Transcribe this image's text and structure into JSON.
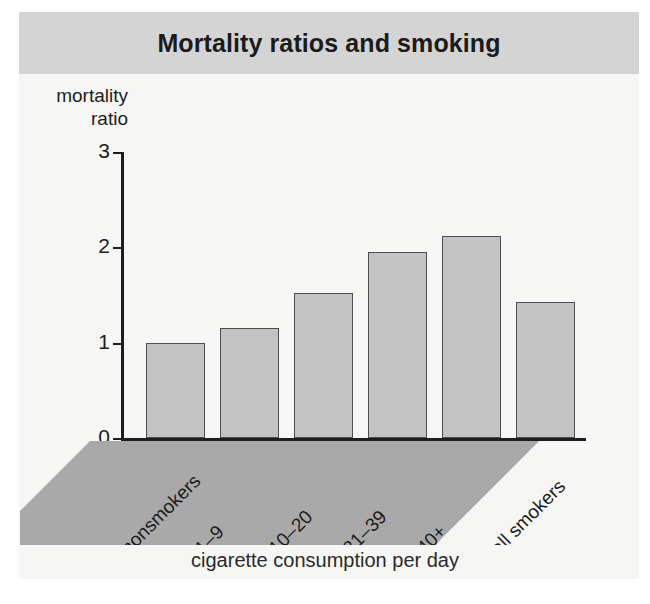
{
  "figure": {
    "title": "Mortality ratios and smoking",
    "background_color": "#f6f6f5",
    "title_bar_color": "#d4d4d4",
    "bar_fill_color": "#c3c3c3",
    "bar_edge_color": "#4e4e4e",
    "band_color": "#a9a9a9"
  },
  "chart_data": {
    "type": "bar",
    "title": "Mortality ratios and smoking",
    "xlabel": "cigarette consumption per day",
    "ylabel": "mortality ratio",
    "ylabel_lines": [
      "mortality",
      "ratio"
    ],
    "categories": [
      "nonsmokers",
      "1–9",
      "10–20",
      "21–39",
      "40+",
      "all smokers"
    ],
    "values": [
      1.0,
      1.15,
      1.52,
      1.95,
      2.12,
      1.43
    ],
    "ylim": [
      0,
      3
    ],
    "yticks": [
      0,
      1,
      2,
      3
    ],
    "ytick_labels": [
      "0",
      "1",
      "2",
      "3"
    ],
    "grid": false,
    "legend": null,
    "xtick_rotation": 45
  }
}
